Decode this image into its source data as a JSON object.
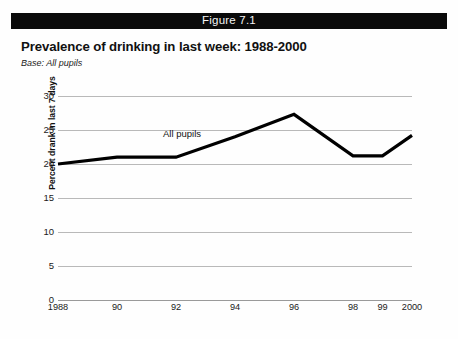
{
  "banner": {
    "label": "Figure 7.1"
  },
  "title": "Prevalence of drinking in last week: 1988-2000",
  "subtitle": "Base: All pupils",
  "colors": {
    "banner_background": "#0a0a0a",
    "banner_text": "#f5f5f5",
    "series_line": "#000000",
    "gridline": "#b9b9b9",
    "page_background": "#fefefe"
  },
  "chart_data": {
    "type": "line",
    "title": "Prevalence of drinking in last week: 1988-2000",
    "subtitle": "Base: All pupils",
    "xlabel": "",
    "ylabel": "Percent drank in last 7 days",
    "categories": [
      "1988",
      "90",
      "92",
      "94",
      "96",
      "98",
      "99",
      "2000"
    ],
    "x": [
      1988,
      1990,
      1992,
      1994,
      1996,
      1998,
      1999,
      2000
    ],
    "series": [
      {
        "name": "All pupils",
        "values": [
          20.0,
          21.0,
          21.0,
          24.0,
          27.3,
          21.2,
          21.2,
          24.2
        ]
      }
    ],
    "ylim": [
      0,
      30
    ],
    "yticks": [
      0,
      5,
      10,
      15,
      20,
      25,
      30
    ],
    "ytick_labels": [
      "0",
      "5",
      "10",
      "15",
      "20",
      "25",
      "30"
    ],
    "grid": true,
    "legend": "inline-annotation",
    "annotations": [
      {
        "text": "All pupils",
        "x": 1993.0,
        "y": 23.6
      }
    ]
  }
}
